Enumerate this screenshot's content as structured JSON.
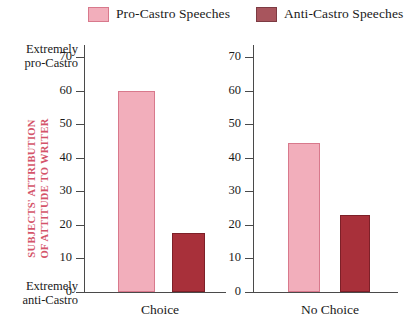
{
  "legend": {
    "entries": [
      {
        "label": "Pro-Castro Speeches",
        "color": "#f2aebb",
        "key": "pro"
      },
      {
        "label": "Anti-Castro Speeches",
        "color": "#a8555d",
        "key": "anti"
      }
    ]
  },
  "axis": {
    "title_line1": "SUBJECTS' ATTRIBUTION",
    "title_line2": "OF ATTITUDE TO WRITER",
    "title_color": "#d4546a",
    "extreme_high_line1": "Extremely",
    "extreme_high_line2": "pro-Castro",
    "extreme_low_line1": "Extremely",
    "extreme_low_line2": "anti-Castro",
    "ticks": [
      "70",
      "60",
      "50",
      "40",
      "30",
      "20",
      "10",
      "0"
    ]
  },
  "panels": [
    {
      "caption": "Choice"
    },
    {
      "caption": "No Choice"
    }
  ],
  "chart_data": {
    "type": "bar",
    "title": "",
    "xlabel": "",
    "ylabel": "SUBJECTS' ATTRIBUTION OF ATTITUDE TO WRITER",
    "ylim": [
      0,
      70
    ],
    "yticks": [
      0,
      10,
      20,
      30,
      40,
      50,
      60,
      70
    ],
    "grid": false,
    "legend_position": "top",
    "categories": [
      "Choice",
      "No Choice"
    ],
    "series": [
      {
        "name": "Pro-Castro Speeches",
        "color": "#f2aebb",
        "values": [
          60,
          44.5
        ]
      },
      {
        "name": "Anti-Castro Speeches",
        "color": "#a8303a",
        "values": [
          17.5,
          23
        ]
      }
    ],
    "annotations": [
      {
        "text": "Extremely pro-Castro",
        "at_y": 70
      },
      {
        "text": "Extremely anti-Castro",
        "at_y": 0
      }
    ]
  }
}
